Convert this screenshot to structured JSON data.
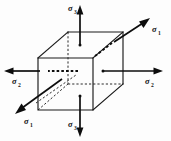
{
  "figure": {
    "type": "engineering-diagram",
    "background_color": "#fdfdfd",
    "line_color": "#1a1a1a",
    "symbol": "σ",
    "labels": {
      "sigma_top": {
        "symbol": "σ",
        "subscript": "3",
        "position": "top",
        "direction": "up"
      },
      "sigma_bottom": {
        "symbol": "σ",
        "subscript": "3",
        "position": "bottom",
        "direction": "down"
      },
      "sigma_left": {
        "symbol": "σ",
        "subscript": "2",
        "position": "left",
        "direction": "left"
      },
      "sigma_right": {
        "symbol": "σ",
        "subscript": "2",
        "position": "right",
        "direction": "right"
      },
      "sigma_upper_right": {
        "symbol": "σ",
        "subscript": "1",
        "position": "upper-right",
        "direction": "up-right"
      },
      "sigma_lower_left": {
        "symbol": "σ",
        "subscript": "1",
        "position": "lower-left",
        "direction": "down-left"
      }
    },
    "geometry": {
      "front_face": {
        "top_left": [
          38,
          58
        ],
        "top_right": [
          93,
          58
        ],
        "bottom_right": [
          93,
          110
        ],
        "bottom_left": [
          38,
          110
        ]
      },
      "back_face": {
        "top_left": [
          68,
          32
        ],
        "top_right": [
          123,
          32
        ],
        "bottom_right": [
          123,
          84
        ],
        "bottom_left": [
          68,
          84
        ]
      },
      "hidden_vertex": [
        68,
        84
      ]
    }
  }
}
